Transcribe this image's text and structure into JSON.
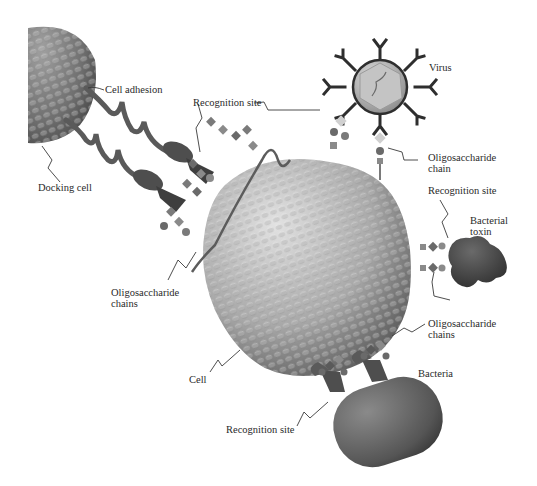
{
  "figure": {
    "colors": {
      "background": "#ffffff",
      "cell_light": "#d4d4d4",
      "cell_dark": "#5a5a5a",
      "protein": "#5c5c5c",
      "protein_dark": "#3c3c3c",
      "sugar": "#8a8a8a",
      "label": "#2a2a2a"
    },
    "labels": {
      "cell_adhesion": "Cell adhesion",
      "docking_cell": "Docking cell",
      "recognition_site_top": "Recognition site",
      "virus": "Virus",
      "oligo_chain_line1": "Oligosaccharide",
      "oligo_chain_line2": "chain",
      "recognition_site_right": "Recognition site",
      "bacterial_toxin_line1": "Bacterial",
      "bacterial_toxin_line2": "toxin",
      "oligo_chains_left_line1": "Oligosaccharide",
      "oligo_chains_left_line2": "chains",
      "oligo_chains_right_line1": "Oligosaccharide",
      "oligo_chains_right_line2": "chains",
      "cell": "Cell",
      "bacteria": "Bacteria",
      "recognition_site_bottom": "Recognition site"
    }
  }
}
